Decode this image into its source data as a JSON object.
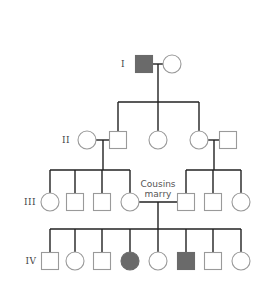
{
  "diagram": {
    "type": "pedigree",
    "colors": {
      "line": "#222222",
      "outline": "#9a9a9a",
      "affected": "#6a6a6a",
      "background": "#ffffff"
    },
    "generations": [
      {
        "label": "I",
        "y": 64
      },
      {
        "label": "II",
        "y": 140
      },
      {
        "label": "III",
        "y": 202
      },
      {
        "label": "IV",
        "y": 261
      }
    ],
    "annotation": {
      "line1": "Cousins",
      "line2": "marry"
    },
    "individuals": [
      {
        "id": "I-1",
        "gen": "I",
        "sex": "male",
        "affected": true,
        "x": 144,
        "y": 64
      },
      {
        "id": "I-2",
        "gen": "I",
        "sex": "female",
        "affected": false,
        "x": 172,
        "y": 64
      },
      {
        "id": "II-1",
        "gen": "II",
        "sex": "female",
        "affected": false,
        "x": 87,
        "y": 140
      },
      {
        "id": "II-2",
        "gen": "II",
        "sex": "male",
        "affected": false,
        "x": 118,
        "y": 140
      },
      {
        "id": "II-3",
        "gen": "II",
        "sex": "female",
        "affected": false,
        "x": 158,
        "y": 140
      },
      {
        "id": "II-4",
        "gen": "II",
        "sex": "female",
        "affected": false,
        "x": 199,
        "y": 140
      },
      {
        "id": "II-5",
        "gen": "II",
        "sex": "male",
        "affected": false,
        "x": 228,
        "y": 140
      },
      {
        "id": "III-1",
        "gen": "III",
        "sex": "female",
        "affected": false,
        "x": 50,
        "y": 202
      },
      {
        "id": "III-2",
        "gen": "III",
        "sex": "male",
        "affected": false,
        "x": 75,
        "y": 202
      },
      {
        "id": "III-3",
        "gen": "III",
        "sex": "male",
        "affected": false,
        "x": 102,
        "y": 202
      },
      {
        "id": "III-4",
        "gen": "III",
        "sex": "female",
        "affected": false,
        "x": 130,
        "y": 202
      },
      {
        "id": "III-5",
        "gen": "III",
        "sex": "male",
        "affected": false,
        "x": 186,
        "y": 202
      },
      {
        "id": "III-6",
        "gen": "III",
        "sex": "male",
        "affected": false,
        "x": 213,
        "y": 202
      },
      {
        "id": "III-7",
        "gen": "III",
        "sex": "female",
        "affected": false,
        "x": 241,
        "y": 202
      },
      {
        "id": "IV-1",
        "gen": "IV",
        "sex": "male",
        "affected": false,
        "x": 50,
        "y": 261
      },
      {
        "id": "IV-2",
        "gen": "IV",
        "sex": "female",
        "affected": false,
        "x": 75,
        "y": 261
      },
      {
        "id": "IV-3",
        "gen": "IV",
        "sex": "male",
        "affected": false,
        "x": 102,
        "y": 261
      },
      {
        "id": "IV-4",
        "gen": "IV",
        "sex": "female",
        "affected": true,
        "x": 130,
        "y": 261
      },
      {
        "id": "IV-5",
        "gen": "IV",
        "sex": "female",
        "affected": false,
        "x": 158,
        "y": 261
      },
      {
        "id": "IV-6",
        "gen": "IV",
        "sex": "male",
        "affected": true,
        "x": 186,
        "y": 261
      },
      {
        "id": "IV-7",
        "gen": "IV",
        "sex": "male",
        "affected": false,
        "x": 213,
        "y": 261
      },
      {
        "id": "IV-8",
        "gen": "IV",
        "sex": "female",
        "affected": false,
        "x": 241,
        "y": 261
      }
    ]
  }
}
